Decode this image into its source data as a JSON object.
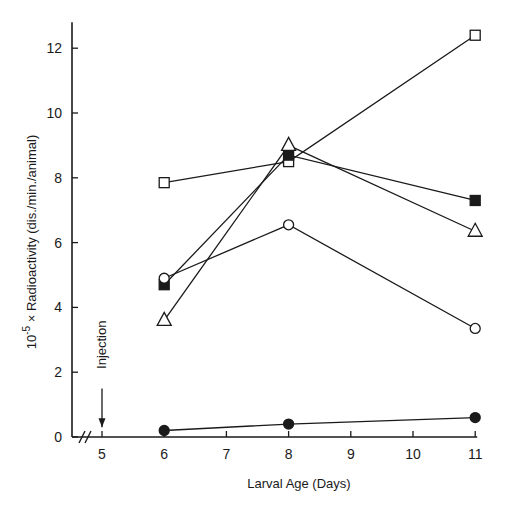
{
  "chart_data": {
    "type": "line",
    "title": "",
    "xlabel": "Larval Age (Days)",
    "ylabel_prefix": "10",
    "ylabel_exp": "-5",
    "ylabel_rest": " × Radioactivity (dis./min./animal)",
    "ylabel": "10^-5 × Radioactivity (dis./min./animal)",
    "x_ticks": [
      5,
      6,
      7,
      8,
      9,
      10,
      11
    ],
    "y_ticks": [
      0,
      2,
      4,
      6,
      8,
      10,
      12
    ],
    "xlim": [
      4.1,
      11.2
    ],
    "ylim": [
      0,
      12.8
    ],
    "grid": false,
    "axis_break": "//",
    "annotation": {
      "text": "Injection",
      "x": 5,
      "arrow_from": 1.5,
      "arrow_to": 0.3
    },
    "series": [
      {
        "name": "open-square",
        "marker": "square",
        "filled": false,
        "x": [
          6,
          8,
          11
        ],
        "values": [
          7.85,
          8.5,
          12.4
        ]
      },
      {
        "name": "filled-square",
        "marker": "square",
        "filled": true,
        "x": [
          6,
          8,
          11
        ],
        "values": [
          4.7,
          8.7,
          7.3
        ]
      },
      {
        "name": "open-triangle",
        "marker": "triangle",
        "filled": false,
        "x": [
          6,
          8,
          11
        ],
        "values": [
          3.6,
          9.0,
          6.35
        ]
      },
      {
        "name": "open-circle",
        "marker": "circle",
        "filled": false,
        "x": [
          6,
          8,
          11
        ],
        "values": [
          4.9,
          6.55,
          3.35
        ]
      },
      {
        "name": "filled-circle",
        "marker": "circle",
        "filled": true,
        "x": [
          6,
          8,
          11
        ],
        "values": [
          0.2,
          0.4,
          0.6
        ]
      }
    ]
  }
}
